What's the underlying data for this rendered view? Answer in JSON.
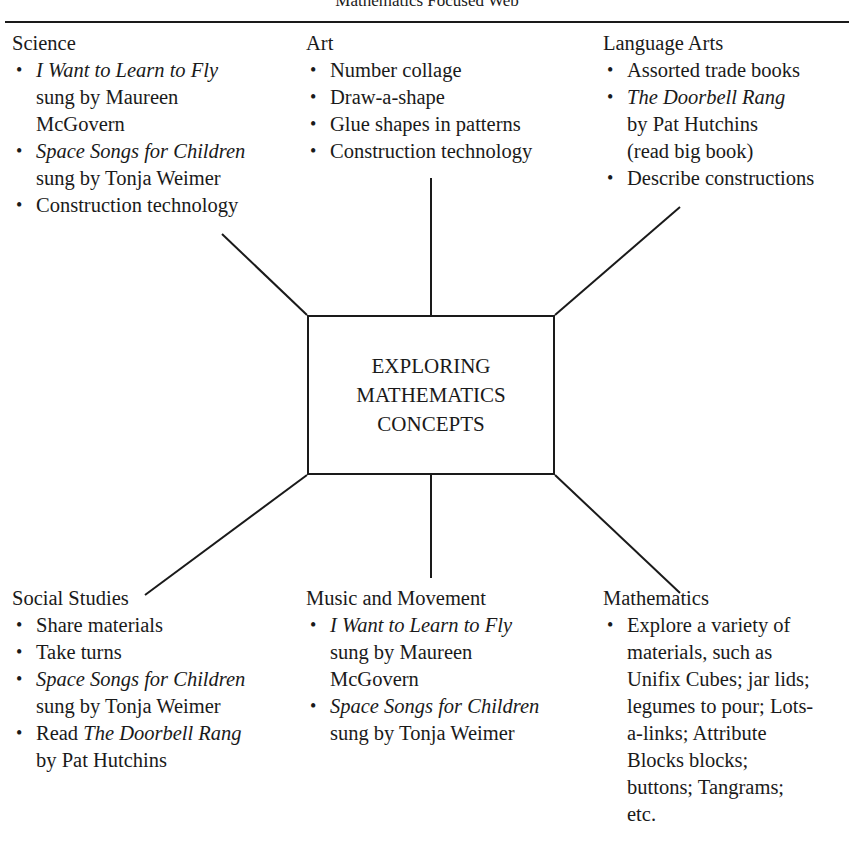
{
  "title": "Mathematics Focused Web",
  "center": {
    "lines": [
      "EXPLORING",
      "MATHEMATICS",
      "CONCEPTS"
    ]
  },
  "science": {
    "heading": "Science",
    "items": [
      {
        "lines": [
          {
            "text": "I Want to Learn to Fly",
            "italic": true
          },
          {
            "text": "sung by Maureen"
          },
          {
            "text": "McGovern"
          }
        ]
      },
      {
        "lines": [
          {
            "text": "Space Songs for Children",
            "italic": true
          },
          {
            "text": "sung by Tonja Weimer"
          }
        ]
      },
      {
        "lines": [
          {
            "text": "Construction technology"
          }
        ]
      }
    ]
  },
  "art": {
    "heading": "Art",
    "items": [
      {
        "lines": [
          {
            "text": "Number collage"
          }
        ]
      },
      {
        "lines": [
          {
            "text": "Draw-a-shape"
          }
        ]
      },
      {
        "lines": [
          {
            "text": "Glue shapes in patterns"
          }
        ]
      },
      {
        "lines": [
          {
            "text": "Construction technology"
          }
        ]
      }
    ]
  },
  "language_arts": {
    "heading": "Language Arts",
    "items": [
      {
        "lines": [
          {
            "text": "Assorted trade books"
          }
        ]
      },
      {
        "lines": [
          {
            "text": "The Doorbell Rang",
            "italic": true
          },
          {
            "text": "by Pat Hutchins"
          },
          {
            "text": "(read big book)"
          }
        ]
      },
      {
        "lines": [
          {
            "text": "Describe constructions"
          }
        ]
      }
    ]
  },
  "social_studies": {
    "heading": "Social Studies",
    "items": [
      {
        "lines": [
          {
            "text": "Share materials"
          }
        ]
      },
      {
        "lines": [
          {
            "text": "Take turns"
          }
        ]
      },
      {
        "lines": [
          {
            "text": "Space Songs for Children",
            "italic": true
          },
          {
            "text": "sung by Tonja Weimer"
          }
        ]
      },
      {
        "lines": [
          {
            "text": "Read ",
            "tail": "The Doorbell Rang",
            "tail_italic": true
          },
          {
            "text": "by Pat Hutchins"
          }
        ]
      }
    ]
  },
  "music_movement": {
    "heading": "Music and Movement",
    "items": [
      {
        "lines": [
          {
            "text": "I Want to Learn to Fly",
            "italic": true
          },
          {
            "text": "sung by Maureen"
          },
          {
            "text": "McGovern"
          }
        ]
      },
      {
        "lines": [
          {
            "text": "Space Songs for Children",
            "italic": true
          },
          {
            "text": "sung by Tonja Weimer"
          }
        ]
      }
    ]
  },
  "mathematics": {
    "heading": "Mathematics",
    "items": [
      {
        "lines": [
          {
            "text": "Explore a variety of"
          },
          {
            "text": "materials, such as"
          },
          {
            "text": "Unifix Cubes; jar lids;"
          },
          {
            "text": "legumes to pour; Lots-"
          },
          {
            "text": "a-links; Attribute"
          },
          {
            "text": "Blocks blocks;"
          },
          {
            "text": "buttons; Tangrams;"
          },
          {
            "text": "etc."
          }
        ]
      }
    ]
  },
  "bullet_glyph": "•",
  "colors": {
    "ink": "#1a1a1a",
    "background": "#ffffff"
  }
}
